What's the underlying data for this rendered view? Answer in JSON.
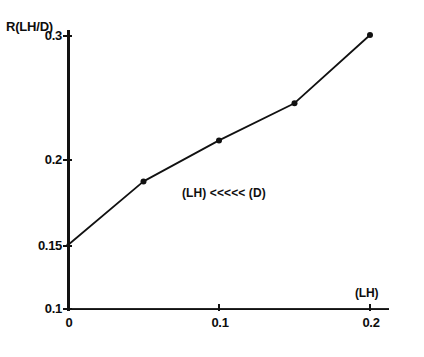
{
  "figure": {
    "background_color": "#ffffff",
    "ink_color": "#111111"
  },
  "chart_data": {
    "type": "line",
    "title": "",
    "subtitle": "",
    "xlabel": "(LH)",
    "ylabel": "R(LH/D)",
    "xlim": [
      0,
      0.21
    ],
    "ylim": [
      0.1,
      0.31
    ],
    "grid": false,
    "legend": null,
    "x_ticks": [
      0,
      0.1,
      0.2
    ],
    "x_tick_labels": [
      "0",
      "0.1",
      "0.2"
    ],
    "y_ticks": [
      0.1,
      0.15,
      0.2,
      0.3
    ],
    "y_tick_labels": [
      "0.1",
      "0.15",
      "0.2",
      "0.3"
    ],
    "marker": "filled-dot",
    "line_style": "solid",
    "series": [
      {
        "name": "R(LH/D) vs (LH)",
        "x": [
          0,
          0.05,
          0.1,
          0.15,
          0.2
        ],
        "values": [
          0.15,
          0.187,
          0.215,
          0.245,
          0.3
        ]
      }
    ],
    "annotations": [
      {
        "text": "(LH) <<<<< (D)",
        "x": 0.078,
        "y": 0.205
      }
    ]
  },
  "axis": {
    "y_title": "R(LH/D)",
    "x_title": "(LH)",
    "y_labels": [
      "0.3",
      "0.2",
      "0.15",
      "0.1"
    ],
    "x_labels": [
      "0",
      "0.1",
      "0.2"
    ]
  },
  "annotation": {
    "text": "(LH) <<<<< (D)"
  }
}
